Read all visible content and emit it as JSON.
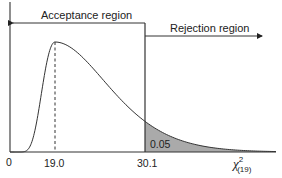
{
  "chart_data": {
    "type": "area",
    "title": "",
    "distribution": "chi-square",
    "degrees_of_freedom": 19,
    "xlabel": "χ²(19)",
    "ylabel": "",
    "x_ticks": [
      "0",
      "19.0",
      "30.1"
    ],
    "mode": 19.0,
    "critical_value": 30.1,
    "alpha": 0.05,
    "regions": [
      {
        "name": "Acceptance region",
        "from": 0,
        "to": 30.1
      },
      {
        "name": "Rejection region",
        "from": 30.1,
        "to": "∞"
      }
    ],
    "shaded_area": {
      "from": 30.1,
      "to": "∞",
      "value": 0.05,
      "label": "0.05"
    },
    "annotations": [
      "dashed vertical line at mode 19.0",
      "solid vertical line at critical value 30.1"
    ],
    "grid": false,
    "legend": "none",
    "colors": {
      "curve": "#333333",
      "shade": "#a9a9a9",
      "axes": "#333333"
    }
  },
  "labels": {
    "acceptance": "Acceptance region",
    "rejection": "Rejection region",
    "tick_0": "0",
    "tick_mode": "19.0",
    "tick_critical": "30.1",
    "shade_value": "0.05",
    "axis_var": "χ",
    "axis_sup": "2",
    "axis_sub": "(19)"
  }
}
